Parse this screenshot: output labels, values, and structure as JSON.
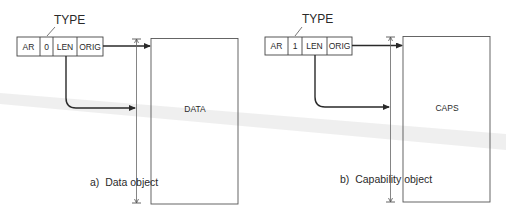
{
  "figure": {
    "panels": [
      {
        "id": "a",
        "type_label": "TYPE",
        "header_cells": [
          "AR",
          "0",
          "LEN",
          "ORIG"
        ],
        "object_label": "DATA",
        "caption": "a)  Data object"
      },
      {
        "id": "b",
        "type_label": "TYPE",
        "header_cells": [
          "AR",
          "1",
          "LEN",
          "ORIG"
        ],
        "object_label": "CAPS",
        "caption": "b)  Capability object"
      }
    ],
    "colors": {
      "line": "#2a2a2a",
      "box_border": "#555555",
      "scan_artifact": "#e6e6e6"
    }
  }
}
